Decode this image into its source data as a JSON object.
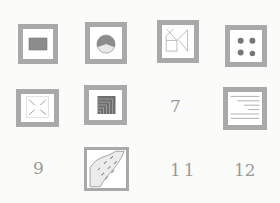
{
  "sheet": {
    "style": "pencil sketch",
    "background": "#fbfbfa",
    "stroke_color": "#a9a9a9",
    "fill_color": "#8c8c8c"
  },
  "grid": {
    "rows": 3,
    "cols": 4,
    "cells": [
      {
        "index": 1,
        "type": "symbol",
        "icon": "filled-rectangle-icon"
      },
      {
        "index": 2,
        "type": "symbol",
        "icon": "pie-circle-icon"
      },
      {
        "index": 3,
        "type": "symbol",
        "icon": "line-network-icon"
      },
      {
        "index": 4,
        "type": "symbol",
        "icon": "four-dots-icon"
      },
      {
        "index": 5,
        "type": "symbol",
        "icon": "corner-arrows-icon"
      },
      {
        "index": 6,
        "type": "symbol",
        "icon": "nested-corners-icon"
      },
      {
        "index": 7,
        "type": "label",
        "label": "7"
      },
      {
        "index": 8,
        "type": "symbol",
        "icon": "horizontal-lines-icon"
      },
      {
        "index": 9,
        "type": "label",
        "label": "9"
      },
      {
        "index": 10,
        "type": "symbol",
        "icon": "river-dashes-icon"
      },
      {
        "index": 11,
        "type": "label",
        "label": "11"
      },
      {
        "index": 12,
        "type": "label",
        "label": "12"
      }
    ]
  }
}
